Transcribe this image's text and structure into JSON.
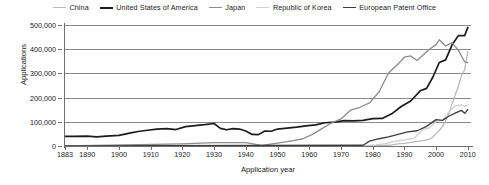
{
  "chart_data": {
    "type": "line",
    "title": "",
    "xlabel": "Application year",
    "ylabel": "Applications",
    "xlim": [
      1883,
      2011
    ],
    "ylim": [
      0,
      500000
    ],
    "grid": "horizontal",
    "legend_position": "top-center",
    "ytick_labels": [
      "0",
      "100,000",
      "200,000",
      "300,000",
      "400,000",
      "500,000"
    ],
    "ytick_values": [
      0,
      100000,
      200000,
      300000,
      400000,
      500000
    ],
    "xtick_labels": [
      "1883",
      "1890",
      "1900",
      "1910",
      "1920",
      "1930",
      "1940",
      "1950",
      "1960",
      "1970",
      "1980",
      "1990",
      "2000",
      "2010"
    ],
    "xtick_values": [
      1883,
      1890,
      1900,
      1910,
      1920,
      1930,
      1940,
      1950,
      1960,
      1970,
      1980,
      1990,
      2000,
      2010
    ],
    "series": [
      {
        "name": "China",
        "color": "#b9b9b9",
        "width": 1.3,
        "x": [
          1883,
          1960,
          1980,
          1985,
          1986,
          1988,
          1990,
          1992,
          1994,
          1996,
          1998,
          1999,
          2000,
          2001,
          2002,
          2003,
          2004,
          2005,
          2006,
          2007,
          2008,
          2009,
          2010
        ],
        "values": [
          0,
          0,
          0,
          3000,
          5000,
          9000,
          11000,
          15000,
          19000,
          22000,
          28000,
          37000,
          51000,
          64000,
          81000,
          105000,
          131000,
          174000,
          211000,
          246000,
          290000,
          315000,
          391000
        ]
      },
      {
        "name": "United States of America",
        "color": "#1c1c1c",
        "width": 1.7,
        "x": [
          1883,
          1886,
          1890,
          1893,
          1896,
          1900,
          1903,
          1906,
          1909,
          1912,
          1915,
          1918,
          1921,
          1924,
          1927,
          1930,
          1932,
          1934,
          1936,
          1938,
          1940,
          1942,
          1944,
          1946,
          1948,
          1950,
          1953,
          1956,
          1959,
          1962,
          1965,
          1968,
          1971,
          1974,
          1977,
          1980,
          1983,
          1986,
          1989,
          1992,
          1995,
          1997,
          1999,
          2001,
          2003,
          2005,
          2007,
          2009,
          2010
        ],
        "values": [
          40000,
          40000,
          41000,
          38000,
          41000,
          44000,
          52000,
          60000,
          65000,
          70000,
          72000,
          68000,
          80000,
          84000,
          88000,
          93000,
          73000,
          67000,
          72000,
          70000,
          62000,
          48000,
          47000,
          62000,
          61000,
          70000,
          74000,
          78000,
          83000,
          87000,
          96000,
          99000,
          105000,
          104000,
          106000,
          113000,
          114000,
          133000,
          163000,
          186000,
          228000,
          238000,
          285000,
          345000,
          356000,
          417000,
          456000,
          456000,
          490000
        ]
      },
      {
        "name": "Japan",
        "color": "#8c8c8c",
        "width": 1.3,
        "x": [
          1883,
          1920,
          1930,
          1940,
          1945,
          1950,
          1955,
          1958,
          1961,
          1964,
          1967,
          1970,
          1973,
          1976,
          1979,
          1982,
          1985,
          1988,
          1990,
          1992,
          1994,
          1996,
          1998,
          2000,
          2001,
          2003,
          2005,
          2007,
          2009,
          2010
        ],
        "values": [
          0,
          9000,
          14000,
          14000,
          3000,
          12000,
          22000,
          30000,
          48000,
          72000,
          95000,
          112000,
          148000,
          160000,
          178000,
          223000,
          302000,
          339000,
          367000,
          372000,
          353000,
          377000,
          401000,
          419000,
          439000,
          413000,
          427000,
          396000,
          348000,
          345000
        ]
      },
      {
        "name": "Republic of Korea",
        "color": "#cfcfcf",
        "width": 1.3,
        "x": [
          1883,
          1970,
          1978,
          1981,
          1984,
          1987,
          1990,
          1993,
          1996,
          1998,
          2000,
          2002,
          2004,
          2006,
          2008,
          2009,
          2010
        ],
        "values": [
          0,
          0,
          2000,
          5000,
          10000,
          19000,
          25000,
          32000,
          68000,
          76000,
          102000,
          106000,
          140000,
          166000,
          170000,
          163000,
          170000
        ]
      },
      {
        "name": "European Patent Office",
        "color": "#3c3c3c",
        "width": 1.3,
        "x": [
          1883,
          1977,
          1979,
          1982,
          1985,
          1988,
          1991,
          1994,
          1997,
          2000,
          2002,
          2004,
          2006,
          2008,
          2009,
          2010
        ],
        "values": [
          0,
          3000,
          20000,
          30000,
          38000,
          48000,
          58000,
          63000,
          81000,
          109000,
          106000,
          123000,
          136000,
          147000,
          135000,
          151000
        ]
      }
    ]
  },
  "legend": {
    "items": [
      {
        "label": "China"
      },
      {
        "label": "United States of America"
      },
      {
        "label": "Japan"
      },
      {
        "label": "Republic of Korea"
      },
      {
        "label": "European Patent Office"
      }
    ]
  }
}
